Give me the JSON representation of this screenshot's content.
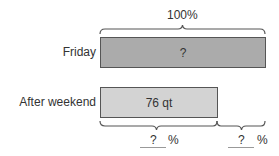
{
  "diagram": {
    "top_label": "100%",
    "rows": [
      {
        "label": "Friday",
        "bar_text": "?",
        "color": "#ababab"
      },
      {
        "label": "After weekend",
        "bar_text": "76 qt",
        "color": "#d3d3d3"
      }
    ],
    "bottom_segments": [
      {
        "blank": "?",
        "unit": "%"
      },
      {
        "blank": "?",
        "unit": "%"
      }
    ]
  }
}
